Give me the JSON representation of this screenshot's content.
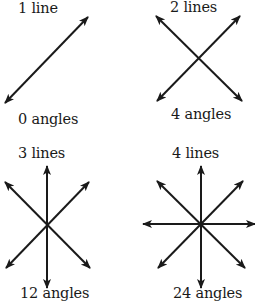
{
  "panels": [
    {
      "top_label": "1 line",
      "bottom_label": "0 angles",
      "lines": 1,
      "angles": 0,
      "segments": [
        [
          88,
          17,
          5,
          103
        ]
      ]
    },
    {
      "top_label": "2 lines",
      "bottom_label": "4 angles",
      "lines": 2,
      "angles": 4,
      "segments": [
        [
          156,
          16,
          242,
          101
        ],
        [
          240,
          16,
          157,
          101
        ]
      ]
    },
    {
      "top_label": "3 lines",
      "bottom_label": "12 angles",
      "lines": 3,
      "angles": 12,
      "segments": [
        [
          47,
          166,
          47,
          288
        ],
        [
          5,
          182,
          90,
          268
        ],
        [
          89,
          182,
          6,
          268
        ]
      ]
    },
    {
      "top_label": "4 lines",
      "bottom_label": "24 angles",
      "lines": 4,
      "angles": 24,
      "segments": [
        [
          201,
          166,
          201,
          288
        ],
        [
          143,
          224,
          255,
          224
        ],
        [
          157,
          181,
          245,
          268
        ],
        [
          243,
          181,
          158,
          268
        ]
      ]
    }
  ],
  "colors": {
    "stroke": "#1a1a1a",
    "text": "#1a1a1a",
    "background": "#ffffff"
  }
}
